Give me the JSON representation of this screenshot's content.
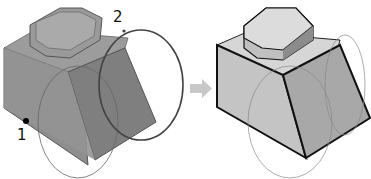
{
  "figure": {
    "left_panel": {
      "description": "selected model with transparent faces and edge-loop selection circles",
      "callouts": [
        {
          "id": "1",
          "label": "1",
          "target": "edge-point"
        },
        {
          "id": "2",
          "label": "2",
          "target": "selection-loop"
        }
      ]
    },
    "arrow": {
      "direction": "right",
      "color": "#c8c8c8"
    },
    "right_panel": {
      "description": "resulting solid model with highlighted edges"
    },
    "colors": {
      "face_light": "#d4d4d4",
      "face_mid": "#bdbdbd",
      "face_dark": "#9a9a9a",
      "edge": "#111111",
      "transparent_face": "#8e8e8e",
      "circle": "#555555"
    }
  }
}
